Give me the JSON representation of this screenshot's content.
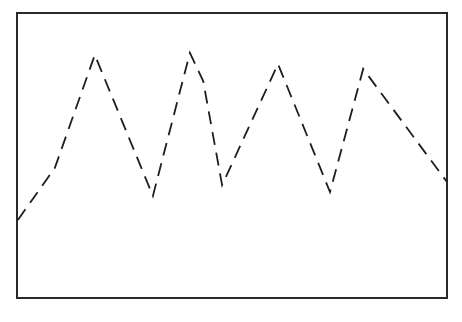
{
  "chart_data": {
    "type": "line",
    "title": "",
    "xlabel": "",
    "ylabel": "",
    "grid": false,
    "legend": null,
    "line_style": "dashed",
    "colors": {
      "line": "#1e1e1e",
      "frame": "#2a2a2a",
      "background": "#ffffff"
    },
    "frame_px": {
      "left": 17,
      "top": 13,
      "right": 447,
      "bottom": 298
    },
    "note": "No axis ticks or labels shown; values are pixel-derived, normalized 0-100 within the frame (x left→right, y bottom→top).",
    "series": [
      {
        "name": "waveform",
        "points_px": [
          [
            18,
            220
          ],
          [
            55,
            168
          ],
          [
            95,
            55
          ],
          [
            153,
            196
          ],
          [
            190,
            54
          ],
          [
            203,
            82
          ],
          [
            222,
            186
          ],
          [
            278,
            65
          ],
          [
            330,
            193
          ],
          [
            363,
            70
          ],
          [
            447,
            183
          ]
        ],
        "x": [
          0.2,
          8.8,
          18.1,
          31.6,
          40.2,
          43.3,
          47.7,
          60.7,
          72.8,
          80.5,
          100
        ],
        "y": [
          27.4,
          45.6,
          85.3,
          35.8,
          86.0,
          76.1,
          39.6,
          82.1,
          37.2,
          80.4,
          40.7
        ]
      }
    ]
  }
}
